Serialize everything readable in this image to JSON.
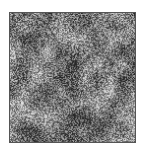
{
  "image": {
    "description": "grayscale random noise texture square",
    "background": "#ffffff",
    "frame_border": "#555555",
    "tone_range": [
      "#3a3a3a",
      "#e8e8e8"
    ]
  }
}
